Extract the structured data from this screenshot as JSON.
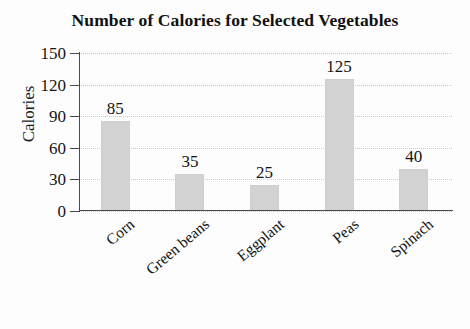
{
  "chart_data": {
    "type": "bar",
    "title": "Number of Calories for Selected Vegetables",
    "xlabel": "",
    "ylabel": "Calories",
    "categories": [
      "Corn",
      "Green beans",
      "Eggplant",
      "Peas",
      "Spinach"
    ],
    "values": [
      85,
      35,
      25,
      125,
      40
    ],
    "value_labels": [
      "85",
      "35",
      "25",
      "125",
      "40"
    ],
    "ylim": [
      0,
      150
    ],
    "yticks": [
      0,
      30,
      60,
      90,
      120,
      150
    ],
    "ytick_labels": [
      "0",
      "30",
      "60",
      "90",
      "120",
      "150"
    ],
    "grid": true,
    "grid_style": "dotted-horizontal",
    "legend": null,
    "bar_color": "#d2d2d2",
    "axis_color": "#4a4a4a",
    "text_color": "#141414",
    "xtick_label_rotation": -40
  }
}
